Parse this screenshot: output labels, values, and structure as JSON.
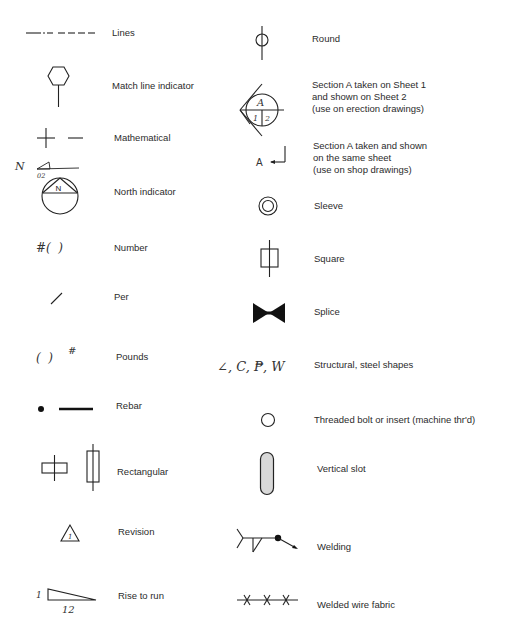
{
  "left_column": [
    {
      "symbol": "dash-dot-dash line",
      "label": "Lines"
    },
    {
      "symbol": "hexagon on stem",
      "label": "Match line indicator"
    },
    {
      "symbol": "+ —",
      "label": "Mathematical"
    },
    {
      "symbol": "circle with triangle and N",
      "label": "North indicator",
      "extra": "N",
      "extra_sub": "02"
    },
    {
      "symbol": "#( )",
      "label": "Number"
    },
    {
      "symbol": "/",
      "label": "Per"
    },
    {
      "symbol": "( )#",
      "label": "Pounds"
    },
    {
      "symbol": "dot and bar",
      "label": "Rebar"
    },
    {
      "symbol": "rectangles on axis",
      "label": "Rectangular"
    },
    {
      "symbol": "triangle with 1",
      "label": "Revision",
      "revision_number": "1"
    },
    {
      "symbol": "slope triangle",
      "label": "Rise to run",
      "rise": "1",
      "run": "12"
    }
  ],
  "right_column": [
    {
      "symbol": "circle on vertical line",
      "label": "Round"
    },
    {
      "symbol": "section circle A over 1|2",
      "label_lines": [
        "Section A taken on Sheet 1",
        "and shown on Sheet 2",
        "(use on erection drawings)"
      ],
      "section": "A",
      "sheet_from": "1",
      "sheet_to": "2"
    },
    {
      "symbol": "A with arrow",
      "label_lines": [
        "Section A taken and shown",
        "on the same sheet",
        "(use on shop drawings)"
      ],
      "section": "A"
    },
    {
      "symbol": "double circle",
      "label": "Sleeve"
    },
    {
      "symbol": "square on vertical line",
      "label": "Square"
    },
    {
      "symbol": "bowtie",
      "label": "Splice"
    },
    {
      "symbol": "∠, C, PL, W",
      "label": "Structural, steel shapes",
      "shapes_text": "∠, C, ₱, W"
    },
    {
      "symbol": "small circle",
      "label": "Threaded bolt or insert (machine thr'd)"
    },
    {
      "symbol": "shaded vertical slot",
      "label": "Vertical slot"
    },
    {
      "symbol": "weld symbol with arrow",
      "label": "Welding"
    },
    {
      "symbol": "line with x marks",
      "label": "Welded wire fabric"
    }
  ]
}
